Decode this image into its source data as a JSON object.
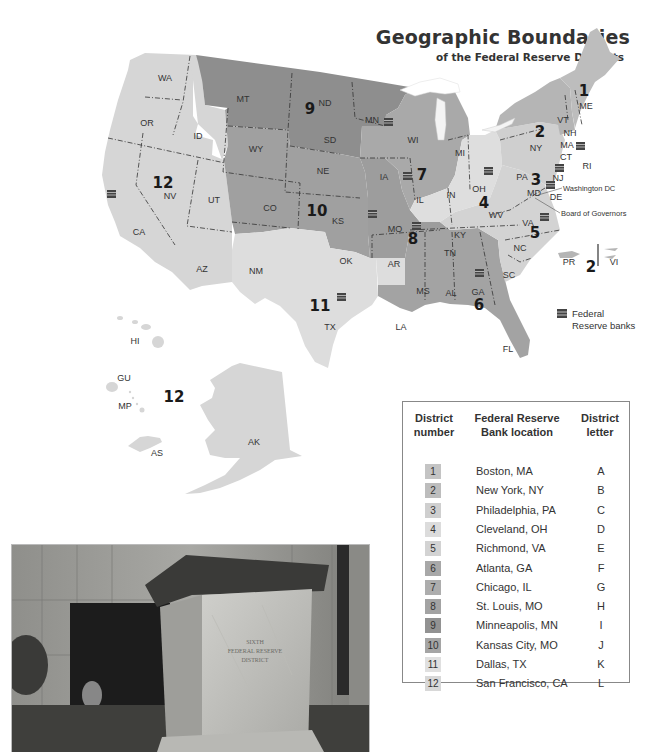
{
  "header": {
    "title": "Geographic Boundaries",
    "subtitle": "of the Federal Reserve Districts"
  },
  "colors": {
    "district_1": "#bdbdbd",
    "district_2": "#b5b5b5",
    "district_3": "#cfcfcf",
    "district_4": "#dedede",
    "district_5": "#d3d3d3",
    "district_6": "#a3a3a3",
    "district_7": "#a9a9a9",
    "district_8": "#9d9d9d",
    "district_9": "#8e8e8e",
    "district_10": "#a0a0a0",
    "district_11": "#dddddd",
    "district_12": "#d6d6d6",
    "boundary": "#333333",
    "water": "#ffffff"
  },
  "map": {
    "state_labels": [
      "WA",
      "OR",
      "ID",
      "CA",
      "NV",
      "UT",
      "AZ",
      "MT",
      "WY",
      "CO",
      "NM",
      "ND",
      "SD",
      "NE",
      "KS",
      "OK",
      "TX",
      "MN",
      "IA",
      "MO",
      "AR",
      "LA",
      "WI",
      "IL",
      "MI",
      "IN",
      "OH",
      "KY",
      "TN",
      "MS",
      "AL",
      "GA",
      "FL",
      "SC",
      "NC",
      "VA",
      "WV",
      "PA",
      "NY",
      "ME",
      "VT",
      "NH",
      "MA",
      "CT",
      "RI",
      "NJ",
      "MD",
      "DE",
      "HI",
      "AK",
      "GU",
      "MP",
      "AS",
      "PR",
      "VI"
    ],
    "district_labels": [
      "1",
      "2",
      "3",
      "4",
      "5",
      "6",
      "7",
      "8",
      "9",
      "10",
      "11",
      "12",
      "2",
      "12"
    ],
    "annotations": {
      "washington_dc": "Washington DC",
      "board_of_governors": "Board of Governors"
    }
  },
  "legend": {
    "icon": "bank-building-icon",
    "label": "Federal Reserve banks"
  },
  "table": {
    "headers": {
      "district_number": [
        "District",
        "number"
      ],
      "bank_location": [
        "Federal Reserve",
        "Bank location"
      ],
      "district_letter": [
        "District",
        "letter"
      ]
    },
    "rows": [
      {
        "number": "1",
        "location": "Boston, MA",
        "letter": "A",
        "shade": "#c4c4c4"
      },
      {
        "number": "2",
        "location": "New York, NY",
        "letter": "B",
        "shade": "#bdbdbd"
      },
      {
        "number": "3",
        "location": "Philadelphia, PA",
        "letter": "C",
        "shade": "#cfcfcf"
      },
      {
        "number": "4",
        "location": "Cleveland, OH",
        "letter": "D",
        "shade": "#dcdcdc"
      },
      {
        "number": "5",
        "location": "Richmond, VA",
        "letter": "E",
        "shade": "#d3d3d3"
      },
      {
        "number": "6",
        "location": "Atlanta, GA",
        "letter": "F",
        "shade": "#a8a8a8"
      },
      {
        "number": "7",
        "location": "Chicago, IL",
        "letter": "G",
        "shade": "#adadad"
      },
      {
        "number": "8",
        "location": "St. Louis, MO",
        "letter": "H",
        "shade": "#a3a3a3"
      },
      {
        "number": "9",
        "location": "Minneapolis, MN",
        "letter": "I",
        "shade": "#929292"
      },
      {
        "number": "10",
        "location": "Kansas City, MO",
        "letter": "J",
        "shade": "#a5a5a5"
      },
      {
        "number": "11",
        "location": "Dallas, TX",
        "letter": "K",
        "shade": "#e0e0e0"
      },
      {
        "number": "12",
        "location": "San Francisco, CA",
        "letter": "L",
        "shade": "#d8d8d8"
      }
    ]
  },
  "photo": {
    "inscription": [
      "SIXTH",
      "FEDERAL RESERVE",
      "DISTRICT"
    ]
  }
}
